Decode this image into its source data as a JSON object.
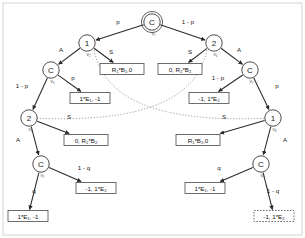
{
  "diagram": {
    "frame_color": "#c9c9c9",
    "node_stroke": "#3a3a3a",
    "edge_color": "#2b2b2b",
    "infoset_color": "#8a8a8a"
  },
  "nodes": [
    {
      "id": "v1",
      "label": "C",
      "vlabel": "v₁",
      "x": 152,
      "y": 22,
      "root": true
    },
    {
      "id": "v2",
      "label": "1",
      "vlabel": "v₂",
      "x": 87,
      "y": 43
    },
    {
      "id": "v6",
      "label": "2",
      "vlabel": "v₆",
      "x": 214,
      "y": 43
    },
    {
      "id": "v3",
      "label": "C",
      "vlabel": "v₃",
      "x": 51,
      "y": 70
    },
    {
      "id": "v7",
      "label": "C",
      "vlabel": "v₇",
      "x": 250,
      "y": 70
    },
    {
      "id": "v4",
      "label": "2",
      "vlabel": "v₄",
      "x": 29,
      "y": 118
    },
    {
      "id": "v8",
      "label": "1",
      "vlabel": "v₈",
      "x": 273,
      "y": 118
    },
    {
      "id": "v5",
      "label": "C",
      "vlabel": "v₅",
      "x": 41,
      "y": 164
    },
    {
      "id": "v9",
      "label": "C",
      "vlabel": "v₉",
      "x": 261,
      "y": 164
    }
  ],
  "edges": [
    {
      "from": "v1",
      "to": "v2",
      "label": "p",
      "lx": 118,
      "ly": 24
    },
    {
      "from": "v1",
      "to": "v6",
      "label": "1 - p",
      "lx": 188,
      "ly": 24
    },
    {
      "from": "v2",
      "to": "v3",
      "label": "A",
      "lx": 61,
      "ly": 52
    },
    {
      "from": "v2",
      "to": "payoff_1",
      "label": "S",
      "lx": 111,
      "ly": 54
    },
    {
      "from": "v6",
      "to": "payoff_2",
      "label": "S",
      "lx": 190,
      "ly": 54
    },
    {
      "from": "v6",
      "to": "v7",
      "label": "A",
      "lx": 239,
      "ly": 52
    },
    {
      "from": "v3",
      "to": "v4",
      "label": "1 - p",
      "lx": 22,
      "ly": 88
    },
    {
      "from": "v3",
      "to": "payoff_3",
      "label": "p",
      "lx": 73,
      "ly": 80
    },
    {
      "from": "v7",
      "to": "payoff_4",
      "label": "1 - p",
      "lx": 218,
      "ly": 80
    },
    {
      "from": "v7",
      "to": "v8",
      "label": "p",
      "lx": 277,
      "ly": 88
    },
    {
      "from": "v4",
      "to": "payoff_5",
      "label": "S",
      "lx": 69,
      "ly": 119
    },
    {
      "from": "v4",
      "to": "v5",
      "label": "A",
      "lx": 18,
      "ly": 142
    },
    {
      "from": "v8",
      "to": "payoff_6",
      "label": "S",
      "lx": 224,
      "ly": 119
    },
    {
      "from": "v8",
      "to": "v9",
      "label": "A",
      "lx": 285,
      "ly": 142
    },
    {
      "from": "v5",
      "to": "payoff_7",
      "label": "q",
      "lx": 34,
      "ly": 193
    },
    {
      "from": "v5",
      "to": "payoff_8",
      "label": "1 - q",
      "lx": 84,
      "ly": 170
    },
    {
      "from": "v9",
      "to": "payoff_9",
      "label": "q",
      "lx": 219,
      "ly": 170
    },
    {
      "from": "v9",
      "to": "payoff_10",
      "label": "1 - q",
      "lx": 273,
      "ly": 193
    }
  ],
  "payoffs": [
    {
      "id": "payoff_1",
      "text": "R₁*B₁,0",
      "x": 122,
      "y": 69,
      "w": 44,
      "h": 11,
      "dashed": false
    },
    {
      "id": "payoff_2",
      "text": "0, R₂*B₂",
      "x": 180,
      "y": 69,
      "w": 44,
      "h": 11,
      "dashed": false
    },
    {
      "id": "payoff_3",
      "text": "1*E₁, -1",
      "x": 90,
      "y": 98,
      "w": 40,
      "h": 11,
      "dashed": false
    },
    {
      "id": "payoff_4",
      "text": "-1, 1*E₂",
      "x": 209,
      "y": 98,
      "w": 40,
      "h": 11,
      "dashed": false
    },
    {
      "id": "payoff_5",
      "text": "0, R₂*B₂",
      "x": 86,
      "y": 140,
      "w": 44,
      "h": 11,
      "dashed": false
    },
    {
      "id": "payoff_6",
      "text": "R₁*B₁,0",
      "x": 198,
      "y": 140,
      "w": 44,
      "h": 11,
      "dashed": false
    },
    {
      "id": "payoff_7",
      "text": "1*E₁, -1",
      "x": 28,
      "y": 216,
      "w": 40,
      "h": 11,
      "dashed": false
    },
    {
      "id": "payoff_8",
      "text": "-1, 1*E₂",
      "x": 96,
      "y": 188,
      "w": 40,
      "h": 11,
      "dashed": false
    },
    {
      "id": "payoff_9",
      "text": "1*E₁, -1",
      "x": 205,
      "y": 188,
      "w": 40,
      "h": 11,
      "dashed": false
    },
    {
      "id": "payoff_10",
      "text": "-1, 1*E₂",
      "x": 274,
      "y": 216,
      "w": 40,
      "h": 11,
      "dashed": true
    }
  ],
  "info_sets": [
    {
      "id": "infoset_left",
      "path": "M 94 50 C 104 96 150 124 272 118"
    },
    {
      "id": "infoset_right",
      "path": "M 207 50 C 197 96 150 124 30 118"
    }
  ]
}
